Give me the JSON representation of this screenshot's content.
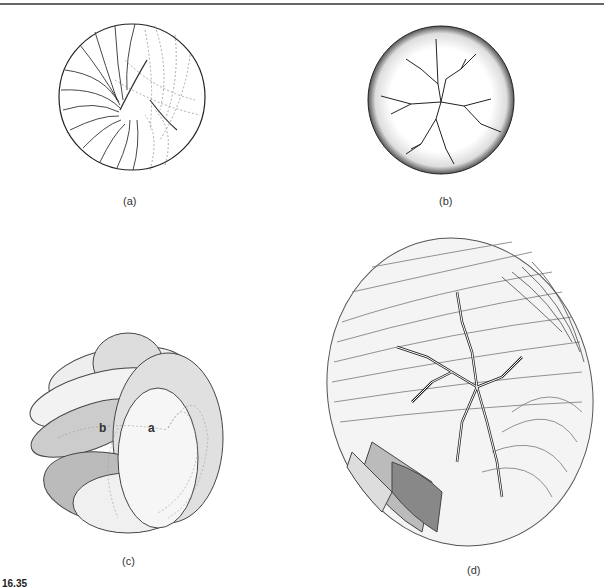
{
  "figure": {
    "caption_number": "16.35",
    "panels": [
      {
        "id": "a",
        "label": "(a)",
        "description": "circle with arcs (solid and dashed)"
      },
      {
        "id": "b",
        "label": "(b)",
        "description": "stippled disc with branching cracks"
      },
      {
        "id": "c",
        "label": "(c)",
        "description": "looped ribbons forming a sphere",
        "points": [
          "a",
          "b"
        ]
      },
      {
        "id": "d",
        "label": "(d)",
        "description": "dense ribbon sphere with branching channels"
      }
    ]
  }
}
